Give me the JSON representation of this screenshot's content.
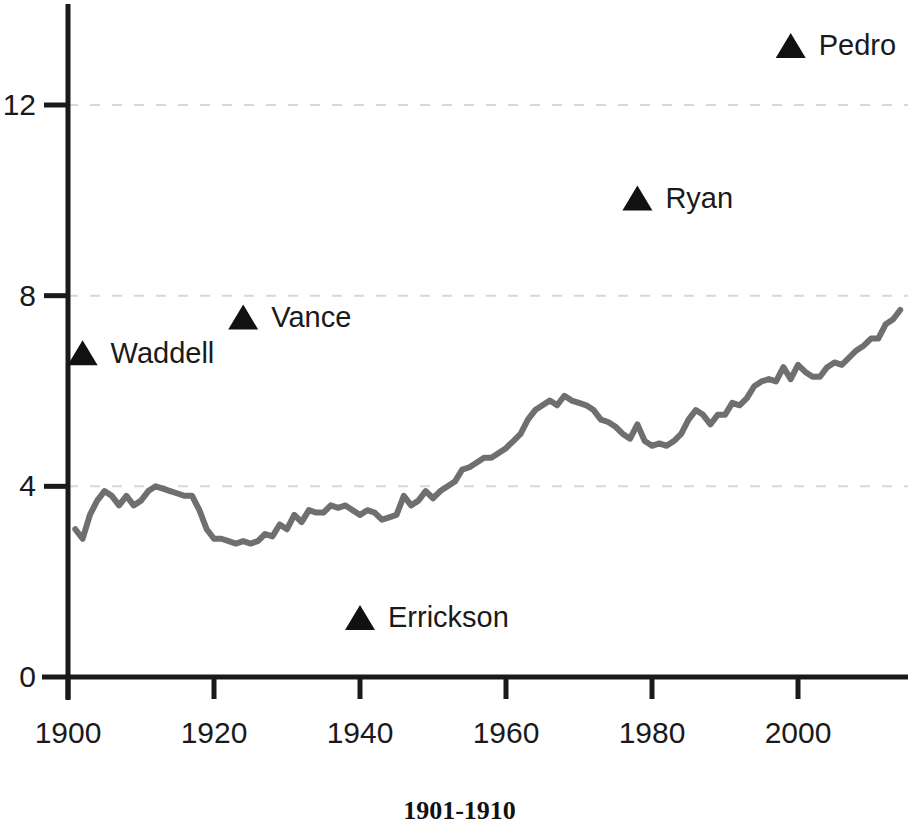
{
  "caption": "1901-1910",
  "colors": {
    "axis": "#1a1a1a",
    "line": "#6f6f6f",
    "gridline": "#d8d8d8",
    "marker": "#111111",
    "background": "#ffffff"
  },
  "axes": {
    "y_ticks": [
      "0",
      "4",
      "8",
      "12"
    ],
    "x_ticks": [
      "1900",
      "1920",
      "1940",
      "1960",
      "1980",
      "2000"
    ],
    "xlim": [
      1900,
      2014
    ],
    "ylim": [
      0,
      13.7
    ],
    "grid": "dashed-horizontal"
  },
  "chart_data": {
    "type": "line",
    "title": "",
    "subtitle": "",
    "xlabel": "",
    "ylabel": "",
    "xlim": [
      1900,
      2014
    ],
    "ylim": [
      0,
      13.7
    ],
    "grid": true,
    "legend": "none",
    "x_ticks": [
      1900,
      1920,
      1940,
      1960,
      1980,
      2000
    ],
    "y_ticks": [
      0,
      4,
      8,
      12
    ],
    "series": [
      {
        "name": "league average",
        "type": "line",
        "color": "#6f6f6f",
        "x": [
          1901,
          1902,
          1903,
          1904,
          1905,
          1906,
          1907,
          1908,
          1909,
          1910,
          1911,
          1912,
          1913,
          1914,
          1915,
          1916,
          1917,
          1918,
          1919,
          1920,
          1921,
          1922,
          1923,
          1924,
          1925,
          1926,
          1927,
          1928,
          1929,
          1930,
          1931,
          1932,
          1933,
          1934,
          1935,
          1936,
          1937,
          1938,
          1939,
          1940,
          1941,
          1942,
          1943,
          1944,
          1945,
          1946,
          1947,
          1948,
          1949,
          1950,
          1951,
          1952,
          1953,
          1954,
          1955,
          1956,
          1957,
          1958,
          1959,
          1960,
          1961,
          1962,
          1963,
          1964,
          1965,
          1966,
          1967,
          1968,
          1969,
          1970,
          1971,
          1972,
          1973,
          1974,
          1975,
          1976,
          1977,
          1978,
          1979,
          1980,
          1981,
          1982,
          1983,
          1984,
          1985,
          1986,
          1987,
          1988,
          1989,
          1990,
          1991,
          1992,
          1993,
          1994,
          1995,
          1996,
          1997,
          1998,
          1999,
          2000,
          2001,
          2002,
          2003,
          2004,
          2005,
          2006,
          2007,
          2008,
          2009,
          2010,
          2011,
          2012,
          2013,
          2014
        ],
        "y": [
          3.1,
          2.9,
          3.4,
          3.7,
          3.9,
          3.8,
          3.6,
          3.8,
          3.6,
          3.7,
          3.9,
          4.0,
          3.95,
          3.9,
          3.85,
          3.8,
          3.8,
          3.5,
          3.1,
          2.9,
          2.9,
          2.85,
          2.8,
          2.85,
          2.8,
          2.85,
          3.0,
          2.95,
          3.2,
          3.1,
          3.4,
          3.25,
          3.5,
          3.45,
          3.45,
          3.6,
          3.55,
          3.6,
          3.5,
          3.4,
          3.5,
          3.45,
          3.3,
          3.35,
          3.4,
          3.8,
          3.6,
          3.7,
          3.9,
          3.75,
          3.9,
          4.0,
          4.1,
          4.35,
          4.4,
          4.5,
          4.6,
          4.6,
          4.7,
          4.8,
          4.95,
          5.1,
          5.4,
          5.6,
          5.7,
          5.8,
          5.7,
          5.9,
          5.8,
          5.75,
          5.7,
          5.6,
          5.4,
          5.35,
          5.25,
          5.1,
          5.0,
          5.3,
          4.95,
          4.85,
          4.9,
          4.85,
          4.95,
          5.1,
          5.4,
          5.6,
          5.5,
          5.3,
          5.5,
          5.5,
          5.75,
          5.7,
          5.85,
          6.1,
          6.2,
          6.25,
          6.2,
          6.5,
          6.25,
          6.55,
          6.4,
          6.3,
          6.3,
          6.5,
          6.6,
          6.55,
          6.7,
          6.85,
          6.95,
          7.1,
          7.1,
          7.4,
          7.5,
          7.7
        ]
      }
    ],
    "annotated_points": [
      {
        "label": "Waddell",
        "x": 1902,
        "y": 6.8,
        "marker": "triangle",
        "label_position": "right"
      },
      {
        "label": "Vance",
        "x": 1924,
        "y": 7.55,
        "marker": "triangle",
        "label_position": "right"
      },
      {
        "label": "Errickson",
        "x": 1940,
        "y": 1.25,
        "marker": "triangle",
        "label_position": "right"
      },
      {
        "label": "Ryan",
        "x": 1978,
        "y": 10.05,
        "marker": "triangle",
        "label_position": "right"
      },
      {
        "label": "Pedro",
        "x": 1999,
        "y": 13.25,
        "marker": "triangle",
        "label_position": "right"
      }
    ]
  }
}
